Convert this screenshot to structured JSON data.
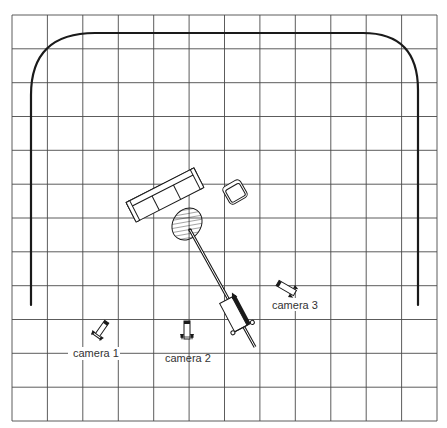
{
  "diagram": {
    "type": "studio floor plan",
    "grid": {
      "columns": 12,
      "rows": 12,
      "left": 12,
      "top": 15,
      "right": 437,
      "bottom": 421,
      "line_color": "#4a4a4a"
    },
    "track": {
      "description": "curved rail / cyclorama outline",
      "color": "#1a1a1a"
    },
    "objects": [
      {
        "id": "sofa",
        "label": "sofa"
      },
      {
        "id": "armchair",
        "label": "armchair"
      },
      {
        "id": "rug",
        "label": "hatched oval table/rug"
      },
      {
        "id": "dolly",
        "label": "camera crane/dolly with boom"
      }
    ],
    "cameras": [
      {
        "id": "camera-1",
        "label": "camera 1"
      },
      {
        "id": "camera-2",
        "label": "camera 2"
      },
      {
        "id": "camera-3",
        "label": "camera 3"
      }
    ]
  }
}
